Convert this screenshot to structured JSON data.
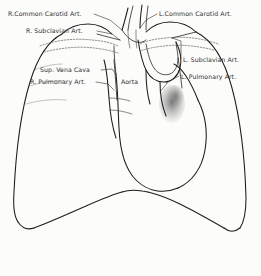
{
  "figure": {
    "medium": "pencil sketch on off-white paper",
    "background_color": "#fcfcfb",
    "ink_color": "#1c1c1c"
  },
  "labels": [
    {
      "id": "r-common-carotid",
      "text": "R.Common Carotid Art.",
      "x": 8,
      "y": 16,
      "anchor": "start",
      "leader": "M 94,14 L 110,20 L 122,30"
    },
    {
      "id": "r-subclavian",
      "text": "R. Subclavian Art.",
      "x": 26,
      "y": 33,
      "anchor": "start",
      "leader": "M 97,31 L 112,34 L 120,40"
    },
    {
      "id": "sup-vena-cava",
      "text": "Sup. Vena Cava",
      "x": 40,
      "y": 72,
      "anchor": "start",
      "leader": "M 101,70 L 112,69 L 116,74"
    },
    {
      "id": "r-pulmonary",
      "text": "R. Pulmonary Art.",
      "x": 30,
      "y": 84,
      "anchor": "start",
      "leader": "M 96,82 L 108,84 L 114,90"
    },
    {
      "id": "aorta",
      "text": "Aorta",
      "x": 121,
      "y": 84,
      "anchor": "start",
      "leader": ""
    },
    {
      "id": "l-common-carotid",
      "text": "L.Common Carotid Art.",
      "x": 159,
      "y": 16,
      "anchor": "start",
      "leader": "M 157,14 L 146,20 L 140,28"
    },
    {
      "id": "l-subclavian",
      "text": "L. Subclavian Art.",
      "x": 183,
      "y": 62,
      "anchor": "start",
      "leader": "M 181,59 L 181,41 L 172,38"
    },
    {
      "id": "l-pulmonary",
      "text": "L. Pulmonary Art.",
      "x": 181,
      "y": 79,
      "anchor": "start",
      "leader": "M 179,76 L 168,82 L 160,92"
    }
  ],
  "anatomy": {
    "right_lung_border": "M 62,34 C 50,40 38,56 30,82 C 22,108 16,150 14,192 C 13,206 14,216 18,222",
    "right_costophrenic": "M 18,222 C 22,228 28,230 34,228",
    "left_lung_border": "M 196,32 C 212,40 224,58 232,88 C 240,118 245,160 246,198 C 246,212 244,222 240,228",
    "left_costophrenic": "M 240,228 C 235,232 229,232 224,228",
    "right_diaphragm": "M 34,228 C 50,222 68,214 86,206 C 102,199 114,194 122,192",
    "left_diaphragm": "M 224,228 C 210,220 196,212 182,205 C 168,198 156,194 148,192",
    "mediastinal_notch": "M 122,192 C 128,190 136,190 142,191 C 145,191 147,192 148,192",
    "right_apex": "M 62,34 C 68,28 78,24 88,24 C 98,24 106,28 112,34",
    "left_apex": "M 196,32 C 190,26 180,22 170,22 C 160,22 152,26 146,32",
    "right_heart_border": "M 116,74 C 118,92 118,110 119,128 C 120,150 124,168 136,180 C 148,192 164,194 178,188",
    "right_heart_upper": "M 114,46 C 114,56 115,64 116,74",
    "svc_lateral": "M 104,60 C 107,70 108,84 109,98 C 110,112 112,126 116,138",
    "svc_medial": "M 114,60 C 115,72 116,86 117,100",
    "left_heart_border": "M 178,188 C 192,182 202,168 205,150 C 208,132 205,114 198,100",
    "aortic_knob": "M 198,100 C 194,90 190,82 186,76 C 182,70 178,66 174,64",
    "aortic_arch_outer": "M 138,40 C 140,52 142,62 146,70 C 150,78 156,82 164,82 C 172,82 178,76 180,68 C 182,60 180,50 176,42",
    "aortic_arch_inner": "M 146,44 C 148,54 150,62 154,68 C 158,74 164,76 170,74 C 175,72 178,66 178,58",
    "asc_aorta_left": "M 146,70 C 146,82 147,94 150,104",
    "asc_aorta_right": "M 160,82 C 160,94 162,106 166,116",
    "desc_aorta": "M 176,42 C 178,56 180,72 182,88",
    "carotid_right_a": "M 122,30 C 124,24 126,16 128,8",
    "carotid_right_b": "M 128,30 C 129,22 131,14 133,6",
    "carotid_left_a": "M 140,28 C 140,20 141,12 142,5",
    "carotid_left_b": "M 146,30 C 146,22 147,14 148,6",
    "innominate": "M 122,30 C 126,36 130,40 136,42 C 140,43 144,42 146,40",
    "subclavian_right": "M 120,40 C 112,38 104,36 97,34",
    "subclavian_left": "M 172,38 C 180,36 188,34 196,32",
    "clavicle_right": "M 40,46 C 56,40 74,38 92,40 C 104,41 112,43 118,46",
    "clavicle_right_lower": "M 44,52 C 60,48 78,46 94,48 C 104,49 112,51 118,53",
    "clavicle_left": "M 218,44 C 202,38 184,36 166,38 C 154,39 146,41 140,44",
    "clavicle_left_lower": "M 214,50 C 198,46 180,44 164,46 C 154,47 146,49 140,51",
    "trachea_left": "M 128,30 C 128,38 129,44 130,48",
    "trachea_right": "M 136,30 C 136,38 136,44 137,48",
    "hilum_right_a": "M 109,98 C 116,98 124,99 130,101",
    "hilum_right_b": "M 110,110 C 118,110 126,112 132,114",
    "rib_marks": [
      "M 34,70 C 44,66 54,64 62,64",
      "M 30,86 C 42,82 54,80 64,81",
      "M 26,104 C 40,100 54,99 66,100"
    ],
    "left_hilum_shade_center": {
      "cx": 172,
      "cy": 104,
      "rx": 13,
      "ry": 18
    }
  }
}
